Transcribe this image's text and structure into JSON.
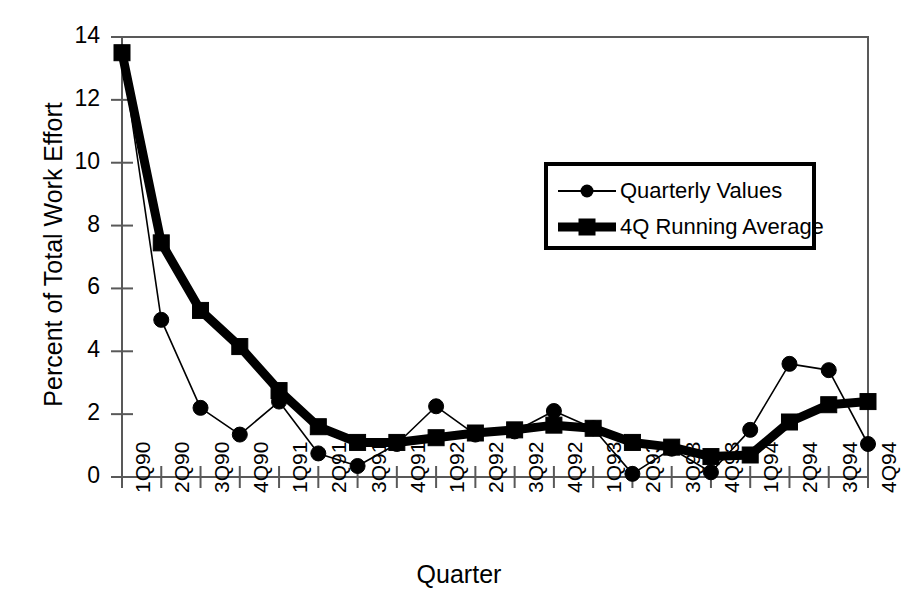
{
  "chart_data": {
    "type": "line",
    "title": "",
    "xlabel": "Quarter",
    "ylabel": "Percent of Total Work Effort",
    "categories": [
      "1Q90",
      "2Q90",
      "3Q90",
      "4Q90",
      "1Q91",
      "2Q91",
      "3Q91",
      "4Q91",
      "1Q92",
      "2Q92",
      "3Q92",
      "4Q92",
      "1Q93",
      "2Q93",
      "3Q93",
      "4Q93",
      "1Q94",
      "2Q94",
      "3Q94",
      "4Q94"
    ],
    "series": [
      {
        "name": "Quarterly Values",
        "marker": "circle",
        "line_width": 1.6,
        "color": "#000000",
        "values": [
          13.5,
          5.0,
          2.2,
          1.35,
          2.4,
          0.75,
          0.35,
          1.05,
          2.25,
          1.35,
          1.45,
          2.1,
          1.55,
          0.1,
          0.9,
          0.15,
          1.5,
          3.6,
          3.4,
          1.05
        ]
      },
      {
        "name": "4Q Running Average",
        "marker": "square",
        "line_width": 9,
        "color": "#000000",
        "values": [
          13.5,
          7.45,
          5.3,
          4.15,
          2.75,
          1.6,
          1.1,
          1.1,
          1.25,
          1.4,
          1.5,
          1.65,
          1.55,
          1.1,
          0.95,
          0.65,
          0.7,
          1.75,
          2.3,
          2.4
        ]
      }
    ],
    "ylim": [
      0,
      14
    ],
    "yticks": [
      0,
      2,
      4,
      6,
      8,
      10,
      12,
      14
    ],
    "ytick_labels": [
      "0",
      "2",
      "4",
      "6",
      "8",
      "10",
      "12",
      "14"
    ],
    "grid": false,
    "legend_position": "upper-right-inset",
    "legend_entries": [
      "Quarterly Values",
      "4Q Running Average"
    ],
    "plot_border": "box",
    "background_color": "#ffffff",
    "axis_color": "#595959"
  }
}
